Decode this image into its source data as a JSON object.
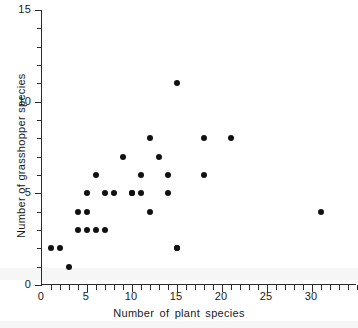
{
  "chart_data": {
    "type": "scatter",
    "title": "",
    "xlabel": "Number of plant species",
    "ylabel": "Number of grasshopper species",
    "xlim": [
      0,
      35
    ],
    "ylim": [
      0,
      15
    ],
    "xticks": [
      0,
      5,
      10,
      15,
      20,
      25,
      30
    ],
    "xtick_labels": [
      "0",
      "5",
      "10",
      "15",
      "20",
      "25",
      "30"
    ],
    "x_minor_step": 1,
    "yticks": [
      0,
      5,
      10,
      15
    ],
    "ytick_labels": [
      "0",
      "5",
      "10",
      "15"
    ],
    "y_minor_step": 1,
    "grid": false,
    "legend": null,
    "marker": "filled-circle",
    "marker_color": "#111111",
    "axis_color": "#2b2b2b",
    "points": [
      {
        "x": 1,
        "y": 2
      },
      {
        "x": 2,
        "y": 2
      },
      {
        "x": 3,
        "y": 1
      },
      {
        "x": 4,
        "y": 3
      },
      {
        "x": 4,
        "y": 4
      },
      {
        "x": 5,
        "y": 3
      },
      {
        "x": 5,
        "y": 4
      },
      {
        "x": 5,
        "y": 5
      },
      {
        "x": 6,
        "y": 3
      },
      {
        "x": 6,
        "y": 6
      },
      {
        "x": 7,
        "y": 3
      },
      {
        "x": 7,
        "y": 5
      },
      {
        "x": 8,
        "y": 5
      },
      {
        "x": 9,
        "y": 7
      },
      {
        "x": 10,
        "y": 5
      },
      {
        "x": 10,
        "y": 5
      },
      {
        "x": 11,
        "y": 6
      },
      {
        "x": 11,
        "y": 5
      },
      {
        "x": 12,
        "y": 8
      },
      {
        "x": 12,
        "y": 4
      },
      {
        "x": 13,
        "y": 7
      },
      {
        "x": 14,
        "y": 6
      },
      {
        "x": 14,
        "y": 5
      },
      {
        "x": 15,
        "y": 11
      },
      {
        "x": 15,
        "y": 2
      },
      {
        "x": 15,
        "y": 2
      },
      {
        "x": 18,
        "y": 8
      },
      {
        "x": 18,
        "y": 6
      },
      {
        "x": 21,
        "y": 8
      },
      {
        "x": 31,
        "y": 4
      }
    ]
  },
  "geometry": {
    "plot_left_px": 41,
    "plot_top_px": 10,
    "plot_width_px": 315,
    "plot_height_px": 275
  }
}
